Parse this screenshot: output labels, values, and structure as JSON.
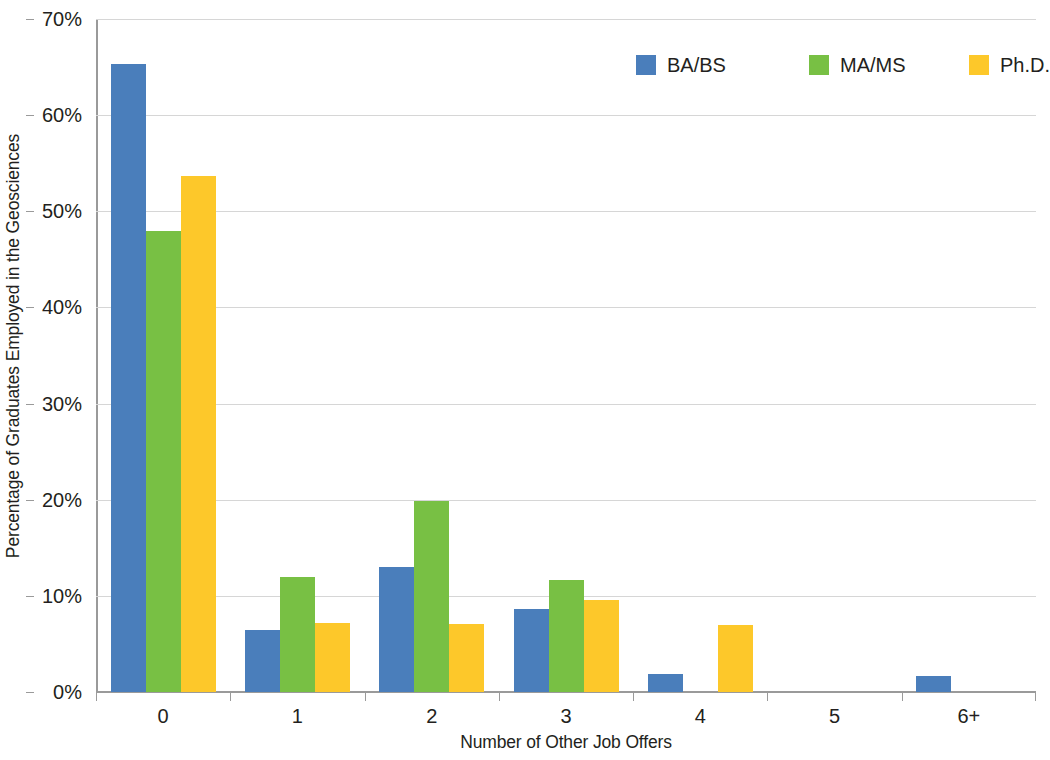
{
  "chart_data": {
    "type": "bar",
    "title": "",
    "xlabel": "Number of Other Job Offers",
    "ylabel": "Percentage of Graduates Employed in the Geosciences",
    "categories": [
      "0",
      "1",
      "2",
      "3",
      "4",
      "5",
      "6+"
    ],
    "ylim": [
      0,
      70
    ],
    "ytick_labels": [
      "0%",
      "10%",
      "20%",
      "30%",
      "40%",
      "50%",
      "60%",
      "70%"
    ],
    "ytick_values": [
      0,
      10,
      20,
      30,
      40,
      50,
      60,
      70
    ],
    "grid": true,
    "legend_position": "top-right",
    "value_suffix": "%",
    "series": [
      {
        "name": "BA/BS",
        "color": "#4a7ebb",
        "values": [
          65.3,
          6.4,
          13.0,
          8.6,
          1.9,
          0,
          1.7
        ]
      },
      {
        "name": "MA/MS",
        "color": "#78c044",
        "values": [
          48.0,
          12.0,
          19.9,
          11.7,
          0,
          0,
          0
        ]
      },
      {
        "name": "Ph.D.",
        "color": "#fdc82a",
        "values": [
          53.7,
          7.2,
          7.1,
          9.6,
          7.0,
          0,
          0
        ]
      }
    ]
  },
  "legend": {
    "items": [
      {
        "label": "BA/BS",
        "color": "#4a7ebb"
      },
      {
        "label": "MA/MS",
        "color": "#78c044"
      },
      {
        "label": "Ph.D.",
        "color": "#fdc82a"
      }
    ]
  },
  "axes": {
    "x_title": "Number of Other Job Offers",
    "y_title": "Percentage of Graduates Employed in the Geosciences"
  }
}
